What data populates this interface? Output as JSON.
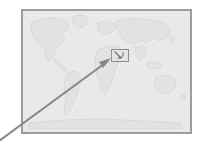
{
  "canvas": {
    "width": 206,
    "height": 150,
    "background_color": "#ffffff"
  },
  "map_panel": {
    "name": "world-map",
    "projection_note": "world map, equirectangular, grayscale",
    "frame_color": "#9d9d9d",
    "frame_width_px": 2,
    "ocean_fill": "#e9e9e9",
    "land_fill": "#e2e2e2",
    "land_stroke": "#d3d3d3",
    "bounds": {
      "left": 21,
      "top": 9,
      "width": 171,
      "height": 125
    },
    "landmass_labels": [
      "North America",
      "South America",
      "Greenland",
      "Europe",
      "Africa",
      "Asia",
      "Australia",
      "Antarctica"
    ]
  },
  "highlight_box": {
    "name": "region-of-interest",
    "border_color": "#8d8d8d",
    "fill_color": "#e4e4e4",
    "marker_color": "#6f6f6f",
    "bounds": {
      "left": 111,
      "top": 49,
      "width": 18,
      "height": 13
    },
    "content_note": "small dark inset marker glyph"
  },
  "pointer_arrow": {
    "name": "callout-arrow",
    "color": "#878787",
    "stroke_width_px": 2,
    "from": {
      "x": -8,
      "y": 146
    },
    "to": {
      "x": 110,
      "y": 60
    },
    "head_length_px": 9,
    "direction": "up-right"
  }
}
